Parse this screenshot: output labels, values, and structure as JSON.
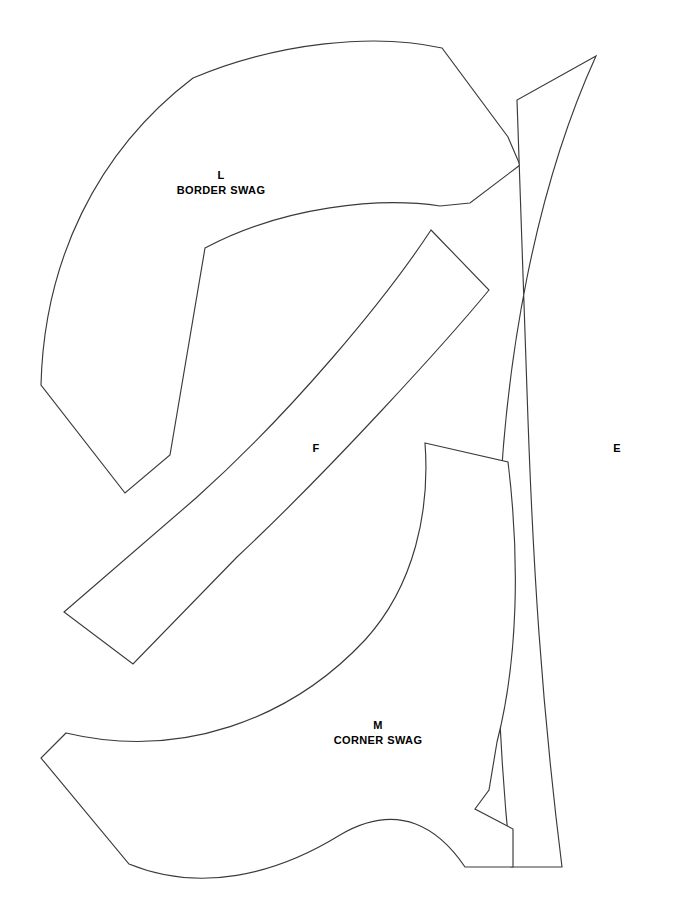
{
  "sheet": {
    "title": "Quilt Pattern Template Sheet",
    "background_color": "#ffffff",
    "line_color": "#3a3a3a",
    "text_color": "#000000",
    "width": 699,
    "height": 918
  },
  "pieces": [
    {
      "code": "L",
      "name": "BORDER SWAG",
      "label_x": 221,
      "label_y": 168,
      "path": "M 41 385 C 44 262 96 152 193 78 C 279 42 375 33 442 48 L 508 137 L 520 165 L 470 203 L 440 206 C 380 197 284 206 205 248 L 170 455 L 125 493 Z"
    },
    {
      "code": "F",
      "name": "",
      "label_x": 316,
      "label_y": 441,
      "path": "M 431 230 L 489 290 C 447 341 330 470 237 557 L 133 664 L 64 612 L 196 498 C 292 412 385 300 431 230 Z"
    },
    {
      "code": "E",
      "name": "",
      "label_x": 617,
      "label_y": 441,
      "path": "M 596 56 L 517 100 C 520 180 524 300 528 420 C 533 560 541 700 562 867 L 511 867 C 500 760 494 640 499 520 C 505 360 535 190 596 56 Z"
    },
    {
      "code": "M",
      "name": "CORNER SWAG",
      "label_x": 378,
      "label_y": 718,
      "path": "M 425 443 L 508 462 C 520 560 518 660 497 742 L 489 790 L 475 809 L 513 829 L 513 867 L 465 867 C 440 830 400 800 340 835 C 275 875 200 893 129 864 L 41 758 L 66 733 C 180 760 290 720 365 640 C 415 585 430 510 425 443 Z"
    }
  ]
}
